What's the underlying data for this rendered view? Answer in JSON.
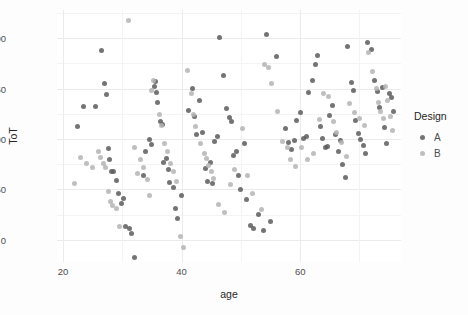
{
  "chart_data": {
    "type": "scatter",
    "title": "",
    "xlabel": "age",
    "ylabel": "ToT",
    "xlim": [
      19,
      77
    ],
    "ylim": [
      -22,
      228
    ],
    "xticks": [
      20,
      40,
      60
    ],
    "yticks": [
      0,
      50,
      100,
      150,
      200
    ],
    "grid": true,
    "legend": {
      "title": "Design",
      "position": "right",
      "entries": [
        {
          "name": "A",
          "color": "#5c5c5c"
        },
        {
          "name": "B",
          "color": "#b4b4b4"
        }
      ]
    },
    "series": [
      {
        "name": "A",
        "color": "#5c5c5c",
        "points": [
          [
            22.5,
            112
          ],
          [
            23.5,
            132
          ],
          [
            25.5,
            132
          ],
          [
            26.5,
            188
          ],
          [
            27.0,
            155
          ],
          [
            27.3,
            144
          ],
          [
            27.6,
            91
          ],
          [
            27.8,
            80
          ],
          [
            28.2,
            68
          ],
          [
            28.6,
            68
          ],
          [
            29.0,
            59
          ],
          [
            29.3,
            46
          ],
          [
            29.8,
            36
          ],
          [
            30.2,
            41
          ],
          [
            30.6,
            13
          ],
          [
            31.2,
            11
          ],
          [
            31.6,
            6
          ],
          [
            32.0,
            -18
          ],
          [
            33.5,
            64
          ],
          [
            34.0,
            88
          ],
          [
            34.6,
            100
          ],
          [
            35.0,
            95
          ],
          [
            35.4,
            152
          ],
          [
            35.6,
            157
          ],
          [
            35.8,
            146
          ],
          [
            36.0,
            136
          ],
          [
            36.4,
            117
          ],
          [
            36.8,
            114
          ],
          [
            37.0,
            77
          ],
          [
            37.4,
            81
          ],
          [
            37.8,
            70
          ],
          [
            38.0,
            57
          ],
          [
            38.6,
            52
          ],
          [
            39.0,
            31
          ],
          [
            39.4,
            21
          ],
          [
            40.0,
            44
          ],
          [
            41.2,
            128
          ],
          [
            41.8,
            150
          ],
          [
            42.2,
            122
          ],
          [
            42.6,
            104
          ],
          [
            43.0,
            138
          ],
          [
            43.6,
            106
          ],
          [
            44.0,
            71
          ],
          [
            44.4,
            58
          ],
          [
            44.8,
            77
          ],
          [
            45.2,
            56
          ],
          [
            45.6,
            98
          ],
          [
            46.0,
            103
          ],
          [
            46.4,
            201
          ],
          [
            47.0,
            163
          ],
          [
            47.6,
            130
          ],
          [
            48.0,
            121
          ],
          [
            48.4,
            117
          ],
          [
            48.8,
            84
          ],
          [
            49.2,
            88
          ],
          [
            49.6,
            64
          ],
          [
            50.0,
            50
          ],
          [
            50.6,
            96
          ],
          [
            51.0,
            40
          ],
          [
            51.6,
            14
          ],
          [
            52.2,
            11
          ],
          [
            53.0,
            25
          ],
          [
            53.8,
            9
          ],
          [
            54.4,
            204
          ],
          [
            55.0,
            18
          ],
          [
            56.0,
            182
          ],
          [
            57.5,
            110
          ],
          [
            58.0,
            97
          ],
          [
            58.6,
            90
          ],
          [
            59.0,
            99
          ],
          [
            59.4,
            118
          ],
          [
            60.0,
            126
          ],
          [
            60.6,
            101
          ],
          [
            61.0,
            103
          ],
          [
            61.4,
            146
          ],
          [
            62.0,
            158
          ],
          [
            62.5,
            174
          ],
          [
            63.0,
            183
          ],
          [
            63.4,
            112
          ],
          [
            63.8,
            101
          ],
          [
            64.2,
            92
          ],
          [
            64.6,
            93
          ],
          [
            65.0,
            123
          ],
          [
            65.4,
            133
          ],
          [
            66.0,
            104
          ],
          [
            66.4,
            88
          ],
          [
            66.8,
            99
          ],
          [
            67.2,
            75
          ],
          [
            67.6,
            62
          ],
          [
            68.0,
            192
          ],
          [
            68.6,
            156
          ],
          [
            69.0,
            148
          ],
          [
            69.4,
            118
          ],
          [
            69.8,
            105
          ],
          [
            70.2,
            100
          ],
          [
            70.6,
            94
          ],
          [
            71.0,
            86
          ],
          [
            71.4,
            196
          ],
          [
            72.0,
            189
          ],
          [
            72.5,
            158
          ],
          [
            73.0,
            147
          ],
          [
            73.4,
            131
          ],
          [
            73.8,
            151
          ],
          [
            74.2,
            111
          ],
          [
            74.6,
            96
          ],
          [
            75.0,
            145
          ],
          [
            75.4,
            141
          ],
          [
            75.8,
            127
          ]
        ]
      },
      {
        "name": "B",
        "color": "#b4b4b4",
        "points": [
          [
            22.0,
            56
          ],
          [
            23.0,
            82
          ],
          [
            24.0,
            76
          ],
          [
            25.0,
            72
          ],
          [
            26.0,
            88
          ],
          [
            26.4,
            82
          ],
          [
            26.8,
            76
          ],
          [
            27.2,
            72
          ],
          [
            27.6,
            48
          ],
          [
            28.0,
            38
          ],
          [
            28.4,
            34
          ],
          [
            29.0,
            31
          ],
          [
            29.6,
            13
          ],
          [
            31.0,
            218
          ],
          [
            32.0,
            92
          ],
          [
            32.6,
            66
          ],
          [
            33.0,
            80
          ],
          [
            33.6,
            72
          ],
          [
            34.2,
            60
          ],
          [
            34.6,
            44
          ],
          [
            35.0,
            148
          ],
          [
            35.2,
            158
          ],
          [
            36.2,
            124
          ],
          [
            36.6,
            113
          ],
          [
            37.2,
            96
          ],
          [
            37.6,
            88
          ],
          [
            38.2,
            76
          ],
          [
            38.6,
            68
          ],
          [
            39.2,
            58
          ],
          [
            39.8,
            3
          ],
          [
            40.4,
            -8
          ],
          [
            41.0,
            168
          ],
          [
            41.6,
            145
          ],
          [
            42.0,
            124
          ],
          [
            42.4,
            112
          ],
          [
            43.2,
            96
          ],
          [
            43.8,
            86
          ],
          [
            44.2,
            81
          ],
          [
            44.6,
            74
          ],
          [
            45.0,
            68
          ],
          [
            45.4,
            61
          ],
          [
            46.2,
            35
          ],
          [
            47.2,
            27
          ],
          [
            48.2,
            55
          ],
          [
            49.0,
            70
          ],
          [
            50.2,
            110
          ],
          [
            51.2,
            64
          ],
          [
            52.0,
            46
          ],
          [
            53.4,
            30
          ],
          [
            54.0,
            174
          ],
          [
            54.6,
            171
          ],
          [
            55.2,
            155
          ],
          [
            56.2,
            127
          ],
          [
            57.0,
            98
          ],
          [
            57.8,
            92
          ],
          [
            58.4,
            80
          ],
          [
            59.2,
            73
          ],
          [
            60.2,
            92
          ],
          [
            61.2,
            80
          ],
          [
            62.2,
            86
          ],
          [
            63.2,
            119
          ],
          [
            64.0,
            145
          ],
          [
            64.8,
            142
          ],
          [
            65.6,
            117
          ],
          [
            66.2,
            106
          ],
          [
            67.0,
            97
          ],
          [
            67.8,
            83
          ],
          [
            68.4,
            135
          ],
          [
            69.2,
            126
          ],
          [
            70.0,
            120
          ],
          [
            70.8,
            113
          ],
          [
            71.6,
            186
          ],
          [
            72.2,
            167
          ],
          [
            72.8,
            150
          ],
          [
            73.2,
            136
          ],
          [
            73.6,
            127
          ],
          [
            74.0,
            120
          ],
          [
            74.4,
            152
          ],
          [
            74.8,
            138
          ],
          [
            75.2,
            122
          ],
          [
            75.6,
            108
          ]
        ]
      }
    ]
  },
  "axes": {
    "y_ticks": [
      "0",
      "50",
      "100",
      "150",
      "200"
    ],
    "x_ticks": [
      "20",
      "40",
      "60"
    ],
    "y_label": "ToT",
    "x_label": "age"
  },
  "legend": {
    "title": "Design",
    "items": [
      {
        "label": "A"
      },
      {
        "label": "B"
      }
    ]
  }
}
